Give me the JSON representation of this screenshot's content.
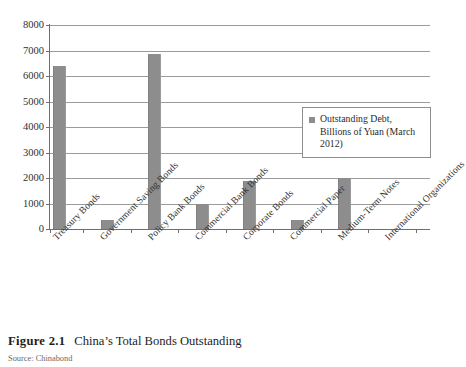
{
  "figure": {
    "caption_prefix": "Figure 2.1",
    "caption_title": "China’s Total Bonds Outstanding",
    "source": "Source: Chinabond"
  },
  "legend": {
    "entries": [
      {
        "label": "Outstanding Debt, Billions of Yuan (March 2012)",
        "color": "#8d8d8d"
      }
    ]
  },
  "colors": {
    "bar": "#8d8d8d",
    "gridline": "#9b9b9b",
    "axis": "#6e6e6e",
    "text": "#2b2b2b",
    "background": "#ffffff"
  },
  "chart_data": {
    "type": "bar",
    "title": "China’s Total Bonds Outstanding",
    "xlabel": "",
    "ylabel": "",
    "ylim": [
      0,
      8000
    ],
    "ytick_step": 1000,
    "yticks": [
      0,
      1000,
      2000,
      3000,
      4000,
      5000,
      6000,
      7000,
      8000
    ],
    "ytick_labels": [
      "0",
      "1000",
      "2000",
      "3000",
      "4000",
      "5000",
      "6000",
      "7000",
      "8000"
    ],
    "grid": true,
    "legend_position": "right-inside",
    "units": "Billions of Yuan",
    "as_of": "March 2012",
    "categories": [
      "Treasury Bonds",
      "Government Saving Bonds",
      "Policy Bank Bonds",
      "Commercial Bank Bonds",
      "Corporate Bonds",
      "Commercial Paper",
      "Medium-Term Notes",
      "International Organizations"
    ],
    "series": [
      {
        "name": "Outstanding Debt, Billions of Yuan (March 2012)",
        "color": "#8d8d8d",
        "values": [
          6400,
          350,
          6850,
          980,
          1880,
          350,
          2020,
          0
        ]
      }
    ]
  }
}
